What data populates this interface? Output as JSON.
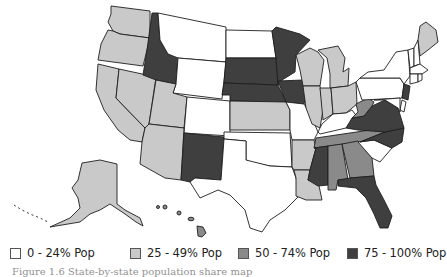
{
  "map": {
    "title": "Population by state (US choropleth)",
    "colors": {
      "c0": "#ffffff",
      "c1": "#c9c9c9",
      "c2": "#8a8a8a",
      "c3": "#3f3f3f",
      "border": "#1e1e1e"
    },
    "states": {
      "WA": "c1",
      "OR": "c1",
      "CA": "c1",
      "NV": "c1",
      "UT": "c1",
      "AZ": "c1",
      "AK": "c1",
      "ID": "c3",
      "MT": "c0",
      "WY": "c0",
      "CO": "c0",
      "NM": "c3",
      "ND": "c0",
      "SD": "c3",
      "NE": "c3",
      "KS": "c1",
      "OK": "c0",
      "TX": "c0",
      "MN": "c3",
      "IA": "c3",
      "MO": "c0",
      "AR": "c1",
      "LA": "c1",
      "WI": "c1",
      "MI": "c1",
      "IL": "c1",
      "IN": "c1",
      "OH": "c1",
      "KY": "c0",
      "TN": "c2",
      "MS": "c3",
      "AL": "c2",
      "GA": "c2",
      "FL": "c3",
      "SC": "c0",
      "NC": "c3",
      "VA": "c3",
      "WV": "c2",
      "PA": "c0",
      "NY": "c0",
      "NJ": "c3",
      "DE": "c0",
      "MD": "c0",
      "ME": "c1",
      "VT": "c0",
      "NH": "c0",
      "MA": "c0",
      "CT": "c0",
      "RI": "c0",
      "HI": "c2"
    }
  },
  "legend": {
    "items": [
      {
        "label": "0 - 24% Pop",
        "color": "#ffffff"
      },
      {
        "label": "25 - 49% Pop",
        "color": "#c9c9c9"
      },
      {
        "label": "50 - 74% Pop",
        "color": "#8a8a8a"
      },
      {
        "label": "75 - 100% Pop",
        "color": "#3f3f3f"
      }
    ]
  },
  "caption": {
    "text": "Figure 1.6 State-by-state population share map"
  }
}
